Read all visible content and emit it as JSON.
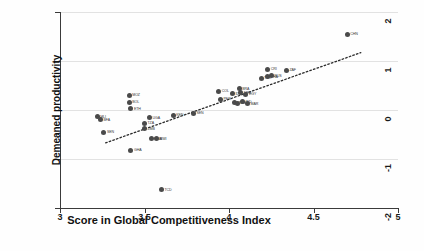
{
  "chart_data": {
    "type": "scatter",
    "title": "",
    "xlabel": "Score in Global Competitiveness Index",
    "ylabel": "Demeaned productivity",
    "xlim": [
      3,
      5
    ],
    "ylim": [
      -2,
      2
    ],
    "xticks": [
      "3",
      "3.5",
      "4",
      "4.5",
      "5"
    ],
    "xtick_values": [
      3,
      3.5,
      4,
      4.5,
      5
    ],
    "yticks": [
      "2",
      "1",
      "0",
      "-1",
      "-2"
    ],
    "ytick_values": [
      2,
      1,
      0,
      -1,
      -2
    ],
    "grid": true,
    "legend": "none",
    "marker_color": "#4a4a4a",
    "trendline": {
      "style": "dotted",
      "color": "#2b2b2b",
      "x_start": 3.27,
      "y_start": -0.67,
      "x_end": 4.78,
      "y_end": 1.17
    },
    "points": [
      {
        "label": "MLI",
        "x": 3.22,
        "y": -0.14
      },
      {
        "label": "BFA",
        "x": 3.24,
        "y": -0.2
      },
      {
        "label": "SEN",
        "x": 3.26,
        "y": -0.45
      },
      {
        "label": "MOZ",
        "x": 3.41,
        "y": 0.3
      },
      {
        "label": "BOL",
        "x": 3.41,
        "y": 0.16
      },
      {
        "label": "ETH",
        "x": 3.42,
        "y": 0.03
      },
      {
        "label": "GHA",
        "x": 3.42,
        "y": -0.82
      },
      {
        "label": "TZA",
        "x": 3.5,
        "y": -0.27
      },
      {
        "label": "ZMB",
        "x": 3.5,
        "y": -0.38
      },
      {
        "label": "UGA",
        "x": 3.53,
        "y": -0.16
      },
      {
        "label": "NGA",
        "x": 3.54,
        "y": -0.59
      },
      {
        "label": "MWI",
        "x": 3.57,
        "y": -0.59
      },
      {
        "label": "TCD",
        "x": 3.6,
        "y": -1.63
      },
      {
        "label": "KEN",
        "x": 3.67,
        "y": -0.11
      },
      {
        "label": "SEN",
        "x": 3.79,
        "y": -0.07
      },
      {
        "label": "COL",
        "x": 3.94,
        "y": 0.38
      },
      {
        "label": "PER",
        "x": 3.95,
        "y": 0.22
      },
      {
        "label": "IDN",
        "x": 4.02,
        "y": 0.33
      },
      {
        "label": "VNM",
        "x": 4.03,
        "y": 0.15
      },
      {
        "label": "PHL",
        "x": 4.05,
        "y": 0.14
      },
      {
        "label": "BRA",
        "x": 4.06,
        "y": 0.43
      },
      {
        "label": "MEX",
        "x": 4.07,
        "y": 0.35
      },
      {
        "label": "IND",
        "x": 4.08,
        "y": 0.17
      },
      {
        "label": "EGY",
        "x": 4.1,
        "y": 0.32
      },
      {
        "label": "MAR",
        "x": 4.11,
        "y": 0.13
      },
      {
        "label": "TUR",
        "x": 4.19,
        "y": 0.65
      },
      {
        "label": "THA",
        "x": 4.23,
        "y": 0.68
      },
      {
        "label": "CRI",
        "x": 4.23,
        "y": 0.83
      },
      {
        "label": "RUS",
        "x": 4.25,
        "y": 0.7
      },
      {
        "label": "ZAF",
        "x": 4.34,
        "y": 0.81
      },
      {
        "label": "CHN",
        "x": 4.7,
        "y": 1.55
      }
    ]
  }
}
